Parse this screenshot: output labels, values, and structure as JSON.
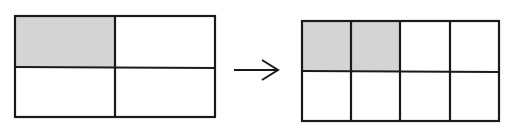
{
  "diagram": {
    "colors": {
      "stroke": "#1a1a1a",
      "shaded": "#d4d4d4",
      "unshaded": "#ffffff",
      "background": "#ffffff"
    },
    "left_grid": {
      "rows": 2,
      "cols": 2,
      "total_parts": 4,
      "shaded_parts": 1,
      "shaded_cells": [
        [
          0,
          0
        ]
      ]
    },
    "arrow": {
      "direction": "right",
      "glyph": "→"
    },
    "right_grid": {
      "rows": 2,
      "cols": 4,
      "total_parts": 8,
      "shaded_parts": 2,
      "shaded_cells": [
        [
          0,
          0
        ],
        [
          0,
          1
        ]
      ]
    }
  }
}
